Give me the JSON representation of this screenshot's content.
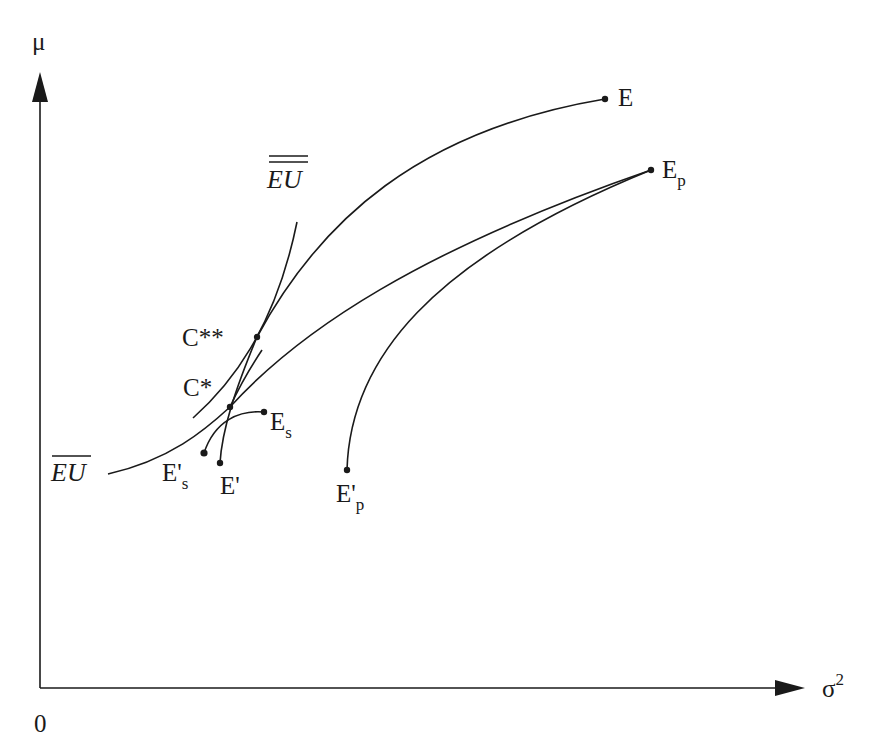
{
  "axes": {
    "y_label": "μ",
    "x_label": "σ",
    "x_label_sup": "2",
    "origin_label": "0"
  },
  "labels": {
    "E": "E",
    "Ep": "E",
    "Ep_sub": "p",
    "Eprime_p": "E'",
    "Eprime_p_sub": "p",
    "Es": "E",
    "Es_sub": "s",
    "Eprime_s": "E'",
    "Eprime_s_sub": "s",
    "Eprime": "E'",
    "C_star": "C*",
    "C_double_star": "C**",
    "EU_bar": "EU",
    "EU_double_bar": "EU"
  },
  "curves": [
    {
      "name": "efficient-frontier-E",
      "from": "C**",
      "to": "E"
    },
    {
      "name": "frontier-Ep",
      "from": "EU-bar",
      "to": "Ep"
    },
    {
      "name": "frontier-Eprime-p",
      "from": "E'p",
      "to": "Ep"
    },
    {
      "name": "frontier-Es",
      "from": "E's",
      "to": "Es"
    },
    {
      "name": "frontier-Eprime",
      "from": "E'",
      "to": "C**"
    },
    {
      "name": "indifference-EU-bar",
      "through": "C*"
    },
    {
      "name": "indifference-EU-double-bar",
      "through": "C**"
    }
  ]
}
